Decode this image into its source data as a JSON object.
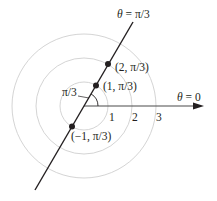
{
  "figure": {
    "type": "polar-coordinates-diagram",
    "colors": {
      "ink": "#231f20",
      "circles": "#c8c8c8",
      "background": "#ffffff"
    }
  },
  "labels": {
    "ray_label_theta": "θ",
    "ray_label_rest": " = π/3",
    "axis_label_theta": "θ",
    "axis_label_rest": " = 0",
    "angle_label": "π/3"
  },
  "ticks": [
    "1",
    "2",
    "3"
  ],
  "points": [
    {
      "label": "(2, π/3)",
      "r": 2,
      "theta": "π/3"
    },
    {
      "label": "(1, π/3)",
      "r": 1,
      "theta": "π/3"
    },
    {
      "label": "(−1, π/3)",
      "r": -1,
      "theta": "π/3"
    }
  ],
  "circles": [
    1,
    2,
    3
  ]
}
